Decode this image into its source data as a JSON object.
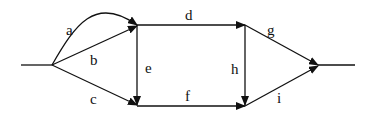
{
  "diagram": {
    "type": "directed-graph",
    "edge_labels": {
      "a": "a",
      "b": "b",
      "c": "c",
      "d": "d",
      "e": "e",
      "f": "f",
      "g": "g",
      "h": "h",
      "i": "i"
    },
    "nodes": [
      {
        "id": "source",
        "x": 52,
        "y": 65
      },
      {
        "id": "top-left",
        "x": 137,
        "y": 25
      },
      {
        "id": "bottom-left",
        "x": 137,
        "y": 105
      },
      {
        "id": "top-right",
        "x": 245,
        "y": 25
      },
      {
        "id": "bottom-right",
        "x": 245,
        "y": 105
      },
      {
        "id": "sink",
        "x": 318,
        "y": 65
      }
    ],
    "edges": [
      {
        "label": "a",
        "from": "source",
        "to": "top-left",
        "shape": "curve"
      },
      {
        "label": "b",
        "from": "source",
        "to": "top-left"
      },
      {
        "label": "c",
        "from": "source",
        "to": "bottom-left"
      },
      {
        "label": "d",
        "from": "top-left",
        "to": "top-right"
      },
      {
        "label": "e",
        "from": "top-left",
        "to": "bottom-left"
      },
      {
        "label": "f",
        "from": "bottom-left",
        "to": "bottom-right"
      },
      {
        "label": "g",
        "from": "top-right",
        "to": "sink"
      },
      {
        "label": "h",
        "from": "top-right",
        "to": "bottom-right"
      },
      {
        "label": "i",
        "from": "bottom-right",
        "to": "sink"
      }
    ],
    "colors": {
      "stroke": "#111111",
      "background": "#ffffff"
    }
  }
}
